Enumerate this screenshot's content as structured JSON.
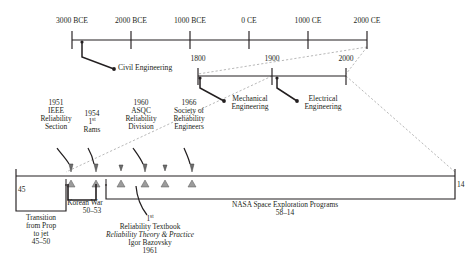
{
  "diagram": {
    "colors": {
      "line": "#231f20",
      "dashed": "#8a8a8a",
      "text": "#231f20"
    },
    "main_timeline": {
      "name": "ancient-to-modern-axis",
      "ticks": [
        {
          "label": "3000 BCE",
          "x": 72
        },
        {
          "label": "2000 BCE",
          "x": 131
        },
        {
          "label": "1000 BCE",
          "x": 190
        },
        {
          "label": "0 CE",
          "x": 249
        },
        {
          "label": "1000 CE",
          "x": 308
        },
        {
          "label": "2000 CE",
          "x": 367
        }
      ],
      "callouts": [
        {
          "label": "Civil Engineering",
          "year_marker_x": 82
        }
      ]
    },
    "second_timeline": {
      "name": "modern-centuries-axis",
      "ticks": [
        {
          "label": "1800",
          "x": 198
        },
        {
          "label": "1900",
          "x": 272
        },
        {
          "label": "2000",
          "x": 346
        }
      ],
      "callouts": [
        {
          "label_line1": "Mechanical",
          "label_line2": "Engineering",
          "marker_x": 200
        },
        {
          "label_line1": "Electrical",
          "label_line2": "Engineering",
          "marker_x": 277
        }
      ]
    },
    "detail_timeline": {
      "name": "reliability-events-axis",
      "start_label": "45",
      "end_label": "14",
      "events_above": [
        {
          "year": "1951",
          "lines": [
            "IEEE",
            "Reliability",
            "Section"
          ],
          "marker_x": 69
        },
        {
          "year": "1954",
          "lines": [
            "1st",
            "Rams"
          ],
          "marker_x": 94,
          "superscript": "st",
          "sup_base": "1"
        },
        {
          "year": "1960",
          "lines": [
            "ASQC",
            "Reliability",
            "Division"
          ],
          "marker_x": 143
        },
        {
          "year": "1966",
          "lines": [
            "Society of",
            "Reliability",
            "Engineers"
          ],
          "marker_x": 190
        }
      ],
      "extra_markers": [
        {
          "marker_x": 163
        },
        {
          "marker_x": 119
        }
      ],
      "bracket_notes": [
        {
          "name": "transition-prop-to-jet",
          "lines": [
            "Transition",
            "from Prop",
            "to jet",
            "45–50"
          ],
          "left_x": 16,
          "right_x": 66,
          "text_center_x": 41
        },
        {
          "name": "korean-war",
          "lines": [
            "Korean War",
            "50–53"
          ],
          "left_x": 68,
          "right_x": 96,
          "text_center_x": 85
        },
        {
          "name": "nasa-space-exploration",
          "lines": [
            "NASA Space Exploration Programs",
            "58–14"
          ],
          "left_x": 106,
          "right_x": 455,
          "text_center_x": 285
        }
      ],
      "leader_note": {
        "name": "reliability-textbook-note",
        "line_sup_base": "1",
        "line_sup": "st",
        "lines": [
          "Reliability Textbook",
          "Reliability Theory & Practice",
          "Igor Bazovsky",
          "1961"
        ],
        "italic_line_index": 1,
        "marker_x": 136,
        "text_center_x": 150
      }
    }
  }
}
